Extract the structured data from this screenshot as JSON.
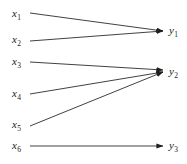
{
  "figure": {
    "kind": "bipartite-mapping-diagram",
    "background_color": "#ffffff",
    "line_color": "#1f1f1f",
    "text_color": "#1a1a1a",
    "width": 187,
    "height": 164
  },
  "source_nodes": [
    {
      "id": "x1",
      "base": "x",
      "sub": "1",
      "x": 12,
      "y": 8
    },
    {
      "id": "x2",
      "base": "x",
      "sub": "2",
      "x": 12,
      "y": 34
    },
    {
      "id": "x3",
      "base": "x",
      "sub": "3",
      "x": 12,
      "y": 56
    },
    {
      "id": "x4",
      "base": "x",
      "sub": "4",
      "x": 12,
      "y": 88
    },
    {
      "id": "x5",
      "base": "x",
      "sub": "5",
      "x": 12,
      "y": 119
    },
    {
      "id": "x6",
      "base": "x",
      "sub": "6",
      "x": 12,
      "y": 140
    }
  ],
  "target_nodes": [
    {
      "id": "y1",
      "base": "y",
      "sub": "1",
      "x": 169,
      "y": 25
    },
    {
      "id": "y2",
      "base": "y",
      "sub": "2",
      "x": 169,
      "y": 66
    },
    {
      "id": "y3",
      "base": "y",
      "sub": "3",
      "x": 169,
      "y": 140
    }
  ],
  "edges": [
    {
      "id": "edge-x1-y1",
      "from": "x1",
      "to": "y1",
      "x1": 30,
      "y1": 13,
      "x2": 163,
      "y2": 31
    },
    {
      "id": "edge-x2-y1",
      "from": "x2",
      "to": "y1",
      "x1": 30,
      "y1": 41,
      "x2": 163,
      "y2": 31
    },
    {
      "id": "edge-x3-y2",
      "from": "x3",
      "to": "y2",
      "x1": 30,
      "y1": 62,
      "x2": 163,
      "y2": 70
    },
    {
      "id": "edge-x4-y2",
      "from": "x4",
      "to": "y2",
      "x1": 30,
      "y1": 94,
      "x2": 163,
      "y2": 72
    },
    {
      "id": "edge-x5-y2",
      "from": "x5",
      "to": "y2",
      "x1": 30,
      "y1": 126,
      "x2": 163,
      "y2": 72
    },
    {
      "id": "edge-x6-y3",
      "from": "x6",
      "to": "y3",
      "x1": 30,
      "y1": 146,
      "x2": 163,
      "y2": 146
    }
  ]
}
